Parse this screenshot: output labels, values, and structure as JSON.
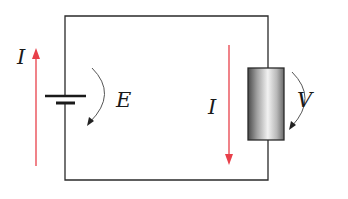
{
  "diagram": {
    "type": "circuit",
    "components": [
      {
        "id": "battery",
        "label": "E",
        "kind": "voltage-source"
      },
      {
        "id": "resistor",
        "label": "V",
        "kind": "resistor"
      }
    ],
    "currents": [
      {
        "id": "current-left",
        "label": "I",
        "direction": "up"
      },
      {
        "id": "current-right",
        "label": "I",
        "direction": "down"
      }
    ],
    "labels": {
      "current_left": "I",
      "emf": "E",
      "current_right": "I",
      "voltage": "V"
    },
    "colors": {
      "wire": "#2a2a2a",
      "current_arrow": "#e8404a",
      "voltage_arrow": "#555555"
    }
  }
}
